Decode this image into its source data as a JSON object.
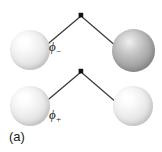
{
  "figure": {
    "panel_label": "(a)",
    "background_color": "#ffffff",
    "line_color": "#3a3a3a",
    "vertex_color": "#111111"
  },
  "diagrams": [
    {
      "id": "antibonding",
      "orbital_label": "ϕ",
      "orbital_subscript": "−",
      "spheres": [
        {
          "position": "left",
          "shade": "light",
          "color": "#e9e9e9"
        },
        {
          "position": "right",
          "shade": "dark",
          "color": "#a8a8a8"
        }
      ],
      "vertex": {
        "x": 81,
        "y": 15
      }
    },
    {
      "id": "bonding",
      "orbital_label": "ϕ",
      "orbital_subscript": "+",
      "spheres": [
        {
          "position": "left",
          "shade": "light",
          "color": "#e9e9e9"
        },
        {
          "position": "right",
          "shade": "light",
          "color": "#e9e9e9"
        }
      ],
      "vertex": {
        "x": 81,
        "y": 71
      }
    }
  ]
}
